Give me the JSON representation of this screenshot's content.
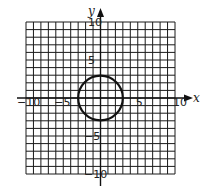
{
  "figure": {
    "type": "coordinate-plane",
    "x_axis_label": "x",
    "y_axis_label": "y",
    "x_range": [
      -10,
      10
    ],
    "y_range": [
      -10,
      10
    ],
    "grid_step": 1,
    "tick_labels": {
      "x": [
        {
          "value": -10,
          "text": "−10"
        },
        {
          "value": -5,
          "text": "−5"
        },
        {
          "value": 5,
          "text": "5"
        },
        {
          "value": 10,
          "text": "10"
        }
      ],
      "y": [
        {
          "value": 10,
          "text": "10"
        },
        {
          "value": 5,
          "text": "5"
        },
        {
          "value": -5,
          "text": "−5"
        },
        {
          "value": -10,
          "text": "−10"
        }
      ]
    },
    "shapes": [
      {
        "type": "circle",
        "center": [
          0,
          0
        ],
        "radius": 3
      }
    ],
    "colors": {
      "grid": "#1a1a1a",
      "curve": "#111111",
      "background": "#ffffff"
    }
  }
}
